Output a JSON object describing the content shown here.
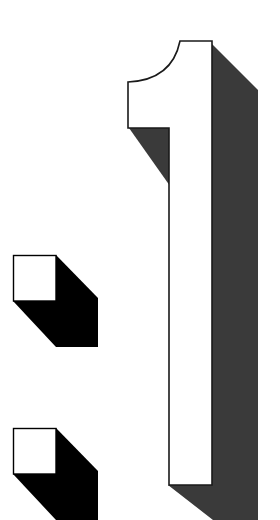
{
  "graphic": {
    "text": "1:",
    "digit": "1",
    "separator": ":",
    "style": "3D block numeral with drop shadow",
    "colors": {
      "background": "#ffffff",
      "face": "#ffffff",
      "outline": "#1a1a1a",
      "digit_shadow": "#3a3a3a",
      "dot_shadow": "#000000"
    }
  }
}
